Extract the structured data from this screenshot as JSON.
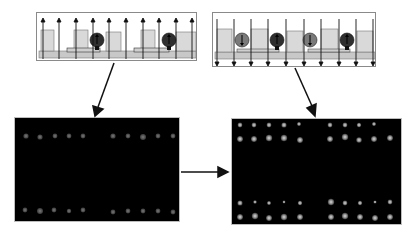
{
  "figure": {
    "panels": {
      "top_left": {
        "label": "schematic-upward-field",
        "field_direction": "up",
        "arrow_count": 10,
        "particles": [
          {
            "x_frac": 0.37,
            "shade": "#2f2f2f"
          },
          {
            "x_frac": 0.82,
            "shade": "#2f2f2f"
          }
        ]
      },
      "top_right": {
        "label": "schematic-downward-field",
        "field_direction": "down",
        "arrow_count": 10,
        "particles": [
          {
            "x_frac": 0.17,
            "shade": "#7a7a7a"
          },
          {
            "x_frac": 0.38,
            "shade": "#2f2f2f"
          },
          {
            "x_frac": 0.58,
            "shade": "#7a7a7a"
          },
          {
            "x_frac": 0.8,
            "shade": "#2f2f2f"
          }
        ]
      },
      "bottom_left": {
        "label": "fluorescence-image-before",
        "rows": 2,
        "spots_per_row": 10,
        "spot_color": "#5e5e5e"
      },
      "bottom_right": {
        "label": "fluorescence-image-after",
        "rows": 4,
        "spots_per_row": 10,
        "spot_color": "#9a9a9a"
      }
    },
    "colors": {
      "well_fill": "#d9d9d9",
      "base_fill": "#c8c8c8",
      "line": "#1a1a1a",
      "plate_bg": "#000000"
    }
  }
}
